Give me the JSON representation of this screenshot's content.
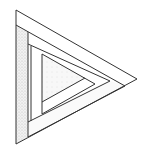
{
  "figure": {
    "type": "line-drawing",
    "colors": {
      "stroke": "#333333",
      "background": "#ffffff",
      "stipple": "#cfcfcf"
    }
  }
}
